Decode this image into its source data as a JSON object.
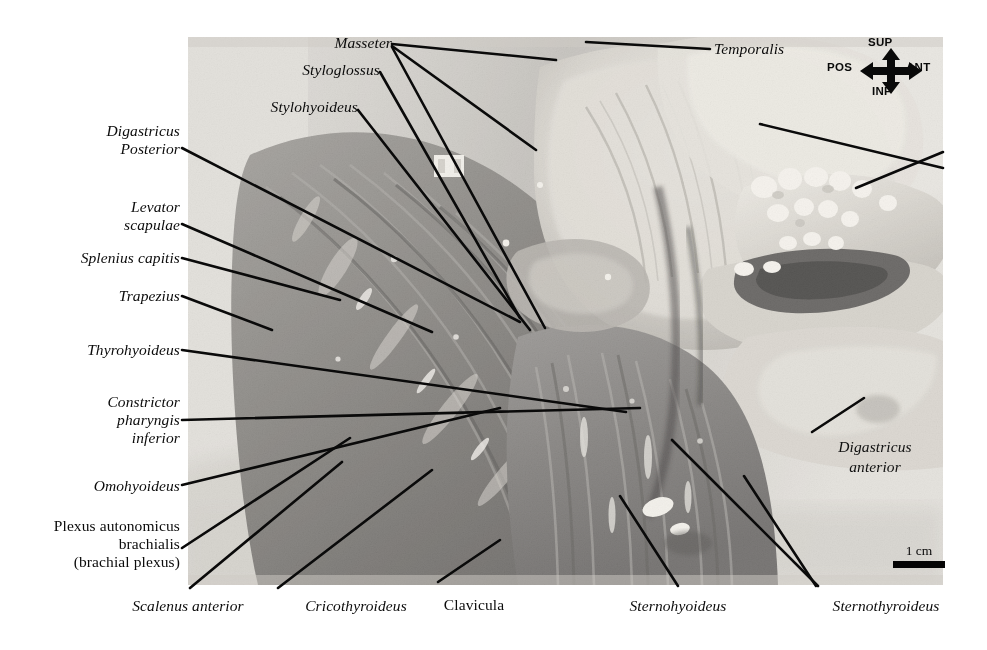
{
  "figure": {
    "kind": "anatomical-dissection-photograph",
    "region": "head and neck, lateral view",
    "background_color": "#ffffff",
    "photo": {
      "x": 188,
      "y": 37,
      "width": 755,
      "height": 548,
      "tone": "grayscale"
    }
  },
  "orientation_compass": {
    "name": "orientation-compass",
    "superior": "SUP",
    "inferior": "INF",
    "posterior": "POS",
    "anterior": "ANT"
  },
  "scale_bar": {
    "label": "1 cm",
    "bar_color": "#050505"
  },
  "labels": {
    "masseter": "Masseter",
    "styloglossus": "Styloglossus",
    "stylohyoideus": "Stylohyoideus",
    "temporalis": "Temporalis",
    "digastricus_posterior_l1": "Digastricus",
    "digastricus_posterior_l2": "Posterior",
    "levator_scapulae_l1": "Levator",
    "levator_scapulae_l2": "scapulae",
    "splenius_capitis": "Splenius capitis",
    "trapezius": "Trapezius",
    "thyrohyoideus": "Thyrohyoideus",
    "constrictor_l1": "Constrictor",
    "constrictor_l2": "pharyngis",
    "constrictor_l3": "inferior",
    "omohyoideus": "Omohyoideus",
    "plexus_l1": "Plexus autonomicus",
    "plexus_l2": "brachialis",
    "plexus_l3": "(brachial plexus)",
    "scalenus_anterior": "Scalenus anterior",
    "cricothyroideus": "Cricothyroideus",
    "clavicula": "Clavicula",
    "sternohyoideus": "Sternohyoideus",
    "sternothyroideus": "Sternothyroideus",
    "digastricus_anterior_l1": "Digastricus",
    "digastricus_anterior_l2": "anterior"
  },
  "colors": {
    "leader_line": "#0a0a0a",
    "text": "#0b0b0b",
    "page": "#ffffff"
  }
}
